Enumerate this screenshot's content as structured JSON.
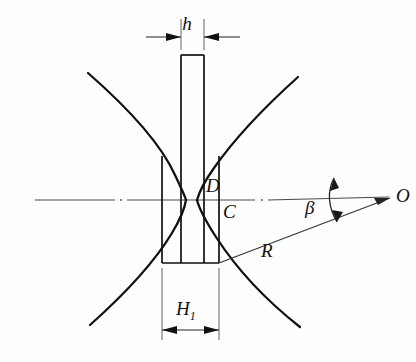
{
  "figure": {
    "background_color": "#fefefe",
    "line_color": "#1a1a1a",
    "centerline_color": "#555555",
    "width": 416,
    "height": 362
  },
  "labels": {
    "h": "h",
    "H": "H",
    "H_subscript": "1",
    "D": "D",
    "C": "C",
    "R": "R",
    "beta": "β",
    "O": "O"
  },
  "geometry": {
    "centerline_y": 200,
    "neck": {
      "left_x": 181,
      "right_x": 204,
      "top_y": 55,
      "width_label": "h"
    },
    "body": {
      "left_x": 162,
      "right_x": 219,
      "bottom_y": 263,
      "width_label": "H1"
    },
    "point_O": {
      "x": 393,
      "y": 196
    },
    "point_C": {
      "x": 213,
      "y": 215
    },
    "point_D": {
      "x": 206,
      "y": 186
    },
    "radius_line": {
      "from_x": 219,
      "from_y": 263,
      "to_x": 390,
      "to_y": 198
    },
    "angle_beta_deg": 21
  },
  "dimensions": {
    "h_line_y": 36,
    "h_label_y": 28,
    "H1_line_y": 330,
    "H1_label_y": 312
  }
}
